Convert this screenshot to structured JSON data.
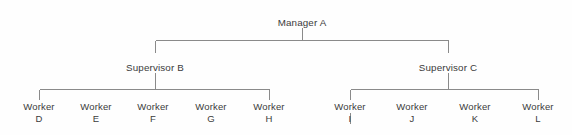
{
  "diagram": {
    "type": "organizational-chart",
    "background_color": "#fefefe",
    "line_color": "#8a8a8a",
    "text_color": "#3b3b3b",
    "levels": 3
  },
  "nodes": {
    "manager": {
      "id": "manager-a",
      "label": "Manager A",
      "role": "Manager",
      "code": "A",
      "level": 1,
      "x": 302,
      "y": 17
    },
    "supervisors": [
      {
        "id": "supervisor-b",
        "label": "Supervisor B",
        "role": "Supervisor",
        "code": "B",
        "level": 2,
        "x": 155,
        "y": 62
      },
      {
        "id": "supervisor-c",
        "label": "Supervisor C",
        "role": "Supervisor",
        "code": "C",
        "level": 2,
        "x": 448,
        "y": 62
      }
    ],
    "workers": [
      {
        "id": "worker-d",
        "role": "Worker",
        "code": "D",
        "parent": "supervisor-b",
        "level": 3,
        "x": 39,
        "y": 106
      },
      {
        "id": "worker-e",
        "role": "Worker",
        "code": "E",
        "parent": "supervisor-b",
        "level": 3,
        "x": 96,
        "y": 106
      },
      {
        "id": "worker-f",
        "role": "Worker",
        "code": "F",
        "parent": "supervisor-b",
        "level": 3,
        "x": 153,
        "y": 106
      },
      {
        "id": "worker-g",
        "role": "Worker",
        "code": "G",
        "parent": "supervisor-b",
        "level": 3,
        "x": 211,
        "y": 106
      },
      {
        "id": "worker-h",
        "role": "Worker",
        "code": "H",
        "parent": "supervisor-b",
        "level": 3,
        "x": 269,
        "y": 106
      },
      {
        "id": "worker-i",
        "role": "Worker",
        "code": "I",
        "parent": "supervisor-c",
        "level": 3,
        "x": 350,
        "y": 106
      },
      {
        "id": "worker-j",
        "role": "Worker",
        "code": "J",
        "parent": "supervisor-c",
        "level": 3,
        "x": 412,
        "y": 106
      },
      {
        "id": "worker-k",
        "role": "Worker",
        "code": "K",
        "parent": "supervisor-c",
        "level": 3,
        "x": 475,
        "y": 106
      },
      {
        "id": "worker-l",
        "role": "Worker",
        "code": "L",
        "parent": "supervisor-c",
        "level": 3,
        "x": 538,
        "y": 106
      }
    ]
  },
  "connectors": {
    "manager_stem": {
      "x": 302,
      "y1": 28,
      "y2": 40
    },
    "top_bus": {
      "y": 40,
      "x1": 155,
      "x2": 448
    },
    "supervisor_b_stem": {
      "x": 155,
      "y1": 40,
      "y2": 53
    },
    "supervisor_c_stem": {
      "x": 448,
      "y1": 40,
      "y2": 53
    },
    "supervisor_b_down_stem": {
      "x": 155,
      "y1": 73,
      "y2": 89
    },
    "supervisor_c_down_stem": {
      "x": 448,
      "y1": 73,
      "y2": 89
    },
    "left_worker_bus": {
      "y": 89,
      "x1": 39,
      "x2": 269
    },
    "right_worker_bus": {
      "y": 89,
      "x1": 350,
      "x2": 538
    },
    "left_end_stems": [
      {
        "x": 39,
        "y1": 89,
        "y2": 100
      },
      {
        "x": 269,
        "y1": 89,
        "y2": 100
      }
    ],
    "right_end_stems": [
      {
        "x": 350,
        "y1": 89,
        "y2": 100
      },
      {
        "x": 538,
        "y1": 89,
        "y2": 100
      }
    ],
    "worker_i_tail": {
      "x": 350,
      "y1": 113,
      "y2": 124
    }
  }
}
